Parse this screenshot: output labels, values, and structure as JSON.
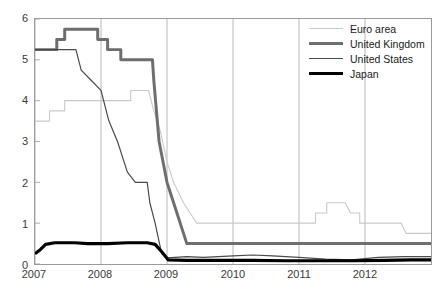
{
  "chart_data": {
    "type": "line",
    "title": "",
    "subtitle": "",
    "xlabel": "",
    "ylabel": "",
    "xlim": [
      2007.0,
      2013.0
    ],
    "ylim": [
      0,
      6
    ],
    "yticks": [
      0,
      1,
      2,
      3,
      4,
      5,
      6
    ],
    "xticks": [
      2007,
      2008,
      2009,
      2010,
      2011,
      2012
    ],
    "xtick_labels": [
      "2007",
      "2008",
      "2009",
      "2010",
      "2011",
      "2012"
    ],
    "ytick_labels": [
      "0",
      "1",
      "2",
      "3",
      "4",
      "5",
      "6"
    ],
    "grid": false,
    "legend_position": "top-right",
    "series": [
      {
        "name": "Euro area",
        "color": "#c9c9c9",
        "width": 1.1,
        "points": [
          [
            2007.0,
            3.5
          ],
          [
            2007.22,
            3.5
          ],
          [
            2007.22,
            3.75
          ],
          [
            2007.45,
            3.75
          ],
          [
            2007.45,
            4.0
          ],
          [
            2008.45,
            4.0
          ],
          [
            2008.45,
            4.25
          ],
          [
            2008.72,
            4.25
          ],
          [
            2008.8,
            3.75
          ],
          [
            2008.9,
            3.25
          ],
          [
            2009.0,
            2.5
          ],
          [
            2009.1,
            2.0
          ],
          [
            2009.25,
            1.5
          ],
          [
            2009.35,
            1.25
          ],
          [
            2009.45,
            1.0
          ],
          [
            2010.95,
            1.0
          ],
          [
            2011.25,
            1.0
          ],
          [
            2011.25,
            1.25
          ],
          [
            2011.42,
            1.25
          ],
          [
            2011.42,
            1.5
          ],
          [
            2011.7,
            1.5
          ],
          [
            2011.78,
            1.25
          ],
          [
            2011.92,
            1.25
          ],
          [
            2011.92,
            1.0
          ],
          [
            2012.55,
            1.0
          ],
          [
            2012.62,
            0.75
          ],
          [
            2013.0,
            0.75
          ]
        ]
      },
      {
        "name": "United Kingdom",
        "color": "#6e6e6e",
        "width": 3.0,
        "points": [
          [
            2007.0,
            5.25
          ],
          [
            2007.33,
            5.25
          ],
          [
            2007.33,
            5.5
          ],
          [
            2007.45,
            5.5
          ],
          [
            2007.45,
            5.75
          ],
          [
            2007.95,
            5.75
          ],
          [
            2007.95,
            5.5
          ],
          [
            2008.1,
            5.5
          ],
          [
            2008.1,
            5.25
          ],
          [
            2008.3,
            5.25
          ],
          [
            2008.3,
            5.0
          ],
          [
            2008.78,
            5.0
          ],
          [
            2008.8,
            4.5
          ],
          [
            2008.88,
            3.0
          ],
          [
            2009.0,
            2.0
          ],
          [
            2009.1,
            1.5
          ],
          [
            2009.2,
            1.0
          ],
          [
            2009.3,
            0.5
          ],
          [
            2013.0,
            0.5
          ]
        ]
      },
      {
        "name": "United States",
        "color": "#4a4a4a",
        "width": 1.2,
        "points": [
          [
            2007.0,
            5.25
          ],
          [
            2007.62,
            5.25
          ],
          [
            2007.7,
            4.75
          ],
          [
            2007.85,
            4.5
          ],
          [
            2008.0,
            4.25
          ],
          [
            2008.12,
            3.5
          ],
          [
            2008.25,
            3.0
          ],
          [
            2008.4,
            2.25
          ],
          [
            2008.52,
            2.0
          ],
          [
            2008.7,
            2.0
          ],
          [
            2008.74,
            1.5
          ],
          [
            2008.82,
            1.0
          ],
          [
            2008.92,
            0.25
          ],
          [
            2009.0,
            0.15
          ],
          [
            2009.3,
            0.18
          ],
          [
            2009.55,
            0.16
          ],
          [
            2010.0,
            0.2
          ],
          [
            2010.3,
            0.22
          ],
          [
            2010.6,
            0.2
          ],
          [
            2011.0,
            0.16
          ],
          [
            2011.4,
            0.12
          ],
          [
            2011.8,
            0.1
          ],
          [
            2012.2,
            0.16
          ],
          [
            2012.6,
            0.18
          ],
          [
            2013.0,
            0.18
          ]
        ]
      },
      {
        "name": "Japan",
        "color": "#000000",
        "width": 3.2,
        "points": [
          [
            2007.0,
            0.25
          ],
          [
            2007.08,
            0.35
          ],
          [
            2007.16,
            0.48
          ],
          [
            2007.3,
            0.52
          ],
          [
            2007.6,
            0.52
          ],
          [
            2007.8,
            0.5
          ],
          [
            2008.1,
            0.5
          ],
          [
            2008.4,
            0.52
          ],
          [
            2008.7,
            0.52
          ],
          [
            2008.82,
            0.48
          ],
          [
            2008.92,
            0.3
          ],
          [
            2009.02,
            0.1
          ],
          [
            2009.3,
            0.09
          ],
          [
            2009.8,
            0.09
          ],
          [
            2010.3,
            0.09
          ],
          [
            2010.8,
            0.08
          ],
          [
            2011.3,
            0.08
          ],
          [
            2011.8,
            0.08
          ],
          [
            2012.3,
            0.09
          ],
          [
            2012.7,
            0.1
          ],
          [
            2013.0,
            0.1
          ]
        ]
      }
    ]
  },
  "legend": {
    "items": [
      {
        "label": "Euro area"
      },
      {
        "label": "United Kingdom"
      },
      {
        "label": "United States"
      },
      {
        "label": "Japan"
      }
    ]
  },
  "axes": {
    "y_labels": [
      "6",
      "5",
      "4",
      "3",
      "2",
      "1",
      "0"
    ],
    "x_labels": [
      "2007",
      "2008",
      "2009",
      "2010",
      "2011",
      "2012"
    ]
  },
  "colors": {
    "euro_area": "#c9c9c9",
    "united_kingdom": "#6e6e6e",
    "united_states": "#4a4a4a",
    "japan": "#000000",
    "axis": "#9a9a9a",
    "text": "#3a3a3a",
    "background": "#ffffff"
  }
}
